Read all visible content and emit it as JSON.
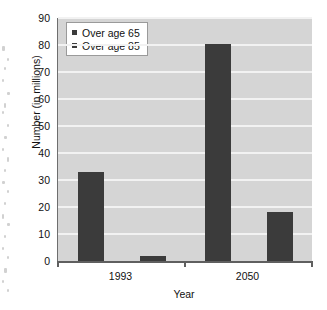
{
  "chart_data": {
    "type": "bar",
    "title": "",
    "xlabel": "Year",
    "ylabel": "Number (in millions)",
    "categories": [
      "1993",
      "2050"
    ],
    "series": [
      {
        "name": "Over age 65",
        "values": [
          33,
          80.5
        ],
        "color": "#3b3b3b"
      },
      {
        "name": "Over age 85",
        "values": [
          2,
          18
        ],
        "color": "#3b3b3b"
      }
    ],
    "ylim": [
      0,
      90
    ],
    "ytick_step": 10,
    "yticks": [
      0,
      10,
      20,
      30,
      40,
      50,
      60,
      70,
      80,
      90
    ],
    "ytick_labels": [
      "0",
      "10",
      "20",
      "30",
      "40",
      "50",
      "60",
      "70",
      "80",
      "90"
    ],
    "grid": true,
    "grid_axis": "y",
    "legend_position": "top-left",
    "plot_background": "#d5d5d5",
    "grid_color": "#f2f2f2",
    "axis_color": "#5f5f5f"
  },
  "legend": {
    "entries": [
      {
        "label": "Over age 65",
        "swatch": "#3b3b3b"
      },
      {
        "label": "Over age 85",
        "swatch": "#3b3b3b"
      }
    ]
  }
}
